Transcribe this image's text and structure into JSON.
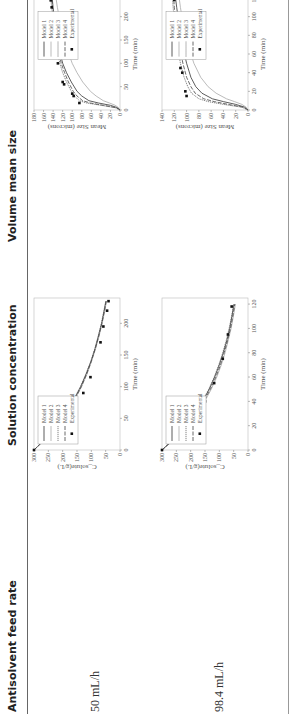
{
  "table": {
    "headers": [
      "Antisolvent feed rate",
      "Solution concentration",
      "Volume mean size"
    ],
    "rows": [
      {
        "feed_rate": "50 mL/h"
      },
      {
        "feed_rate": "98.4 mL/h"
      }
    ]
  },
  "chart_data": [
    {
      "type": "line",
      "title": "Solution concentration, 50 mL/h",
      "xlabel": "Time (min)",
      "ylabel": "C_solute(g/L)",
      "xlim": [
        0,
        240
      ],
      "ylim": [
        0,
        300
      ],
      "xticks": [
        0,
        50,
        100,
        150,
        200
      ],
      "yticks": [
        0,
        50,
        100,
        150,
        200,
        250,
        300
      ],
      "legend": [
        "Model 1",
        "Model 2",
        "Model 3",
        "Model 4",
        "Experimental"
      ],
      "series": [
        {
          "name": "Model 1",
          "x": [
            0,
            20,
            40,
            60,
            80,
            100,
            120,
            140,
            160,
            180,
            200,
            220,
            235
          ],
          "y": [
            300,
            255,
            218,
            187,
            160,
            137,
            118,
            101,
            87,
            75,
            64,
            55,
            49
          ]
        },
        {
          "name": "Model 2",
          "x": [
            0,
            20,
            40,
            60,
            80,
            100,
            120,
            140,
            160,
            180,
            200,
            220,
            235
          ],
          "y": [
            300,
            253,
            215,
            184,
            157,
            134,
            115,
            99,
            85,
            73,
            62,
            53,
            47
          ]
        },
        {
          "name": "Model 3",
          "x": [
            0,
            20,
            40,
            60,
            80,
            100,
            120,
            140,
            160,
            180,
            200,
            220,
            235
          ],
          "y": [
            300,
            256,
            219,
            188,
            161,
            138,
            119,
            102,
            88,
            76,
            65,
            56,
            50
          ]
        },
        {
          "name": "Model 4",
          "x": [
            0,
            20,
            40,
            60,
            80,
            100,
            120,
            140,
            160,
            180,
            200,
            220,
            235
          ],
          "y": [
            300,
            254,
            216,
            185,
            158,
            135,
            116,
            100,
            86,
            74,
            63,
            54,
            48
          ]
        },
        {
          "name": "Experimental",
          "x": [
            0,
            15,
            30,
            42,
            55,
            70,
            90,
            115,
            170,
            195,
            220,
            235
          ],
          "y": [
            300,
            272,
            228,
            208,
            182,
            158,
            128,
            103,
            68,
            58,
            45,
            40
          ]
        }
      ]
    },
    {
      "type": "line",
      "title": "Solution concentration, 98.4 mL/h",
      "xlabel": "Time (min)",
      "ylabel": "C_solute(g/L)",
      "xlim": [
        0,
        125
      ],
      "ylim": [
        0,
        300
      ],
      "xticks": [
        0,
        20,
        40,
        60,
        80,
        100,
        120
      ],
      "yticks": [
        0,
        50,
        100,
        150,
        200,
        250,
        300
      ],
      "legend": [
        "Model 1",
        "Model 2",
        "Model 3",
        "Model 4",
        "Experimental"
      ],
      "series": [
        {
          "name": "Model 1",
          "x": [
            0,
            10,
            20,
            30,
            40,
            50,
            60,
            70,
            80,
            90,
            100,
            110,
            120
          ],
          "y": [
            300,
            255,
            217,
            185,
            158,
            135,
            116,
            100,
            86,
            74,
            64,
            56,
            49
          ]
        },
        {
          "name": "Model 2",
          "x": [
            0,
            10,
            20,
            30,
            40,
            50,
            60,
            70,
            80,
            90,
            100,
            110,
            120
          ],
          "y": [
            300,
            250,
            210,
            178,
            151,
            128,
            109,
            93,
            80,
            69,
            59,
            51,
            44
          ]
        },
        {
          "name": "Model 3",
          "x": [
            0,
            10,
            20,
            30,
            40,
            50,
            60,
            70,
            80,
            90,
            100,
            110,
            120
          ],
          "y": [
            300,
            256,
            219,
            187,
            160,
            137,
            118,
            102,
            88,
            76,
            66,
            57,
            50
          ]
        },
        {
          "name": "Model 4",
          "x": [
            0,
            10,
            20,
            30,
            40,
            50,
            60,
            70,
            80,
            90,
            100,
            110,
            120
          ],
          "y": [
            300,
            252,
            213,
            181,
            154,
            131,
            112,
            96,
            83,
            71,
            61,
            53,
            46
          ]
        },
        {
          "name": "Experimental",
          "x": [
            0,
            10,
            25,
            40,
            55,
            75,
            95,
            118
          ],
          "y": [
            300,
            255,
            192,
            150,
            118,
            88,
            70,
            57
          ]
        }
      ]
    },
    {
      "type": "line",
      "title": "Volume mean size, 50 mL/h",
      "xlabel": "Time (min)",
      "ylabel": "Mean Size (microns)",
      "xlim": [
        0,
        240
      ],
      "ylim": [
        0,
        180
      ],
      "xticks": [
        0,
        50,
        100,
        150,
        200
      ],
      "yticks": [
        0,
        20,
        40,
        60,
        80,
        100,
        120,
        140,
        160,
        180
      ],
      "legend": [
        "Model 1",
        "Model 2",
        "Model 3",
        "Model 4",
        "Experimental"
      ],
      "series": [
        {
          "name": "Model 1",
          "x": [
            0,
            5,
            10,
            15,
            20,
            30,
            40,
            60,
            80,
            100,
            140,
            180,
            220,
            240
          ],
          "y": [
            0,
            5,
            20,
            45,
            65,
            80,
            90,
            102,
            112,
            120,
            130,
            136,
            140,
            142
          ]
        },
        {
          "name": "Model 2",
          "x": [
            0,
            5,
            10,
            15,
            20,
            30,
            40,
            60,
            80,
            100,
            140,
            180,
            220,
            240
          ],
          "y": [
            0,
            3,
            10,
            22,
            35,
            50,
            62,
            78,
            90,
            100,
            114,
            124,
            131,
            134
          ]
        },
        {
          "name": "Model 3",
          "x": [
            0,
            5,
            10,
            15,
            20,
            30,
            40,
            60,
            80,
            100,
            140,
            180,
            220,
            240
          ],
          "y": [
            0,
            10,
            40,
            70,
            85,
            95,
            102,
            112,
            120,
            126,
            134,
            139,
            143,
            145
          ]
        },
        {
          "name": "Model 4",
          "x": [
            0,
            5,
            10,
            15,
            20,
            30,
            40,
            60,
            80,
            100,
            140,
            180,
            220,
            240
          ],
          "y": [
            0,
            8,
            35,
            62,
            78,
            90,
            98,
            108,
            116,
            123,
            131,
            137,
            141,
            143
          ]
        },
        {
          "name": "Experimental",
          "x": [
            15,
            30,
            35,
            55,
            60,
            100,
            170,
            190,
            220,
            235
          ],
          "y": [
            85,
            97,
            100,
            117,
            120,
            130,
            120,
            140,
            143,
            145
          ]
        }
      ]
    },
    {
      "type": "line",
      "title": "Volume mean size, 98.4 mL/h",
      "xlabel": "Time (min)",
      "ylabel": "Mean Size (microns)",
      "xlim": [
        0,
        120
      ],
      "ylim": [
        0,
        140
      ],
      "xticks": [
        0,
        20,
        40,
        60,
        80,
        100,
        120
      ],
      "yticks": [
        0,
        20,
        40,
        60,
        80,
        100,
        120,
        140
      ],
      "legend": [
        "Model 1",
        "Model 2",
        "Model 3",
        "Model 4",
        "Experimental"
      ],
      "series": [
        {
          "name": "Model 1",
          "x": [
            0,
            3,
            6,
            9,
            12,
            18,
            25,
            35,
            50,
            70,
            90,
            110,
            120
          ],
          "y": [
            0,
            5,
            20,
            40,
            58,
            75,
            85,
            93,
            100,
            107,
            112,
            116,
            118
          ]
        },
        {
          "name": "Model 2",
          "x": [
            0,
            3,
            6,
            9,
            12,
            18,
            25,
            35,
            50,
            70,
            90,
            110,
            120
          ],
          "y": [
            0,
            3,
            10,
            22,
            35,
            52,
            65,
            77,
            88,
            98,
            105,
            110,
            112
          ]
        },
        {
          "name": "Model 3",
          "x": [
            0,
            3,
            6,
            9,
            12,
            18,
            25,
            35,
            50,
            70,
            90,
            110,
            120
          ],
          "y": [
            0,
            10,
            40,
            65,
            80,
            92,
            98,
            104,
            110,
            115,
            119,
            122,
            123
          ]
        },
        {
          "name": "Model 4",
          "x": [
            0,
            3,
            6,
            9,
            12,
            18,
            25,
            35,
            50,
            70,
            90,
            110,
            120
          ],
          "y": [
            0,
            8,
            32,
            55,
            72,
            86,
            93,
            100,
            106,
            112,
            117,
            120,
            121
          ]
        },
        {
          "name": "Experimental",
          "x": [
            15,
            20,
            40,
            45,
            60,
            80,
            118
          ],
          "y": [
            100,
            102,
            107,
            110,
            112,
            120,
            120
          ]
        }
      ]
    }
  ]
}
